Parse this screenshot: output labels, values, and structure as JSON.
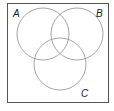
{
  "diagram": {
    "type": "venn",
    "universe": {
      "x": 7,
      "y": 3,
      "width": 102,
      "height": 100,
      "stroke": "#555555"
    },
    "sets": [
      {
        "label": "A",
        "cx": 43,
        "cy": 34,
        "r": 26,
        "label_x": 13,
        "label_y": 17
      },
      {
        "label": "B",
        "cx": 77,
        "cy": 34,
        "r": 26,
        "label_x": 96,
        "label_y": 17
      },
      {
        "label": "C",
        "cx": 60,
        "cy": 64,
        "r": 26,
        "label_x": 81,
        "label_y": 97
      }
    ],
    "circle_stroke": "#9a9a9a"
  }
}
